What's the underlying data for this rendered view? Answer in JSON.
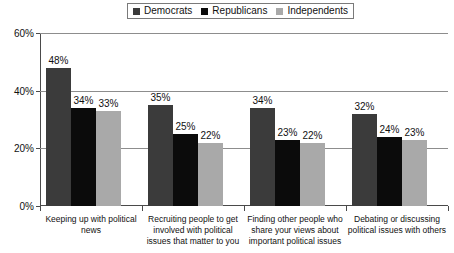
{
  "legend": {
    "entries": [
      {
        "label": "Democrats",
        "color": "#3b3b3b",
        "icon": "square-swatch-icon"
      },
      {
        "label": "Republicans",
        "color": "#0b0b0b",
        "icon": "square-swatch-icon"
      },
      {
        "label": "Independents",
        "color": "#a9a9a9",
        "icon": "square-swatch-icon"
      }
    ]
  },
  "axis": {
    "y_ticks": [
      "0%",
      "20%",
      "40%",
      "60%"
    ],
    "y_tick_values": [
      0,
      20,
      40,
      60
    ]
  },
  "chart_data": {
    "type": "bar",
    "title": "",
    "subtitle": "",
    "xlabel": "",
    "ylabel": "",
    "ylim": [
      0,
      60
    ],
    "ytick_labels": [
      "0%",
      "20%",
      "40%",
      "60%"
    ],
    "grid": true,
    "legend_position": "top-center",
    "value_label_suffix": "%",
    "categories": [
      "Keeping up with political news",
      "Recruiting people to get involved with political issues that matter to you",
      "Finding other people who share your views about important political issues",
      "Debating or discussing political issues with others"
    ],
    "series": [
      {
        "name": "Democrats",
        "color": "#3b3b3b",
        "values": [
          48,
          35,
          34,
          32
        ],
        "labels": [
          "48%",
          "35%",
          "34%",
          "32%"
        ]
      },
      {
        "name": "Republicans",
        "color": "#0b0b0b",
        "values": [
          34,
          25,
          23,
          24
        ],
        "labels": [
          "34%",
          "25%",
          "23%",
          "24%"
        ]
      },
      {
        "name": "Independents",
        "color": "#a9a9a9",
        "values": [
          33,
          22,
          22,
          23
        ],
        "labels": [
          "33%",
          "22%",
          "22%",
          "23%"
        ]
      }
    ]
  }
}
